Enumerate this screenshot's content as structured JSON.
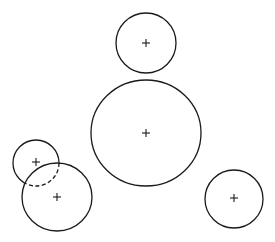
{
  "diagram": {
    "type": "circles",
    "background": "#ffffff",
    "stroke_color": "#1a1a1a",
    "circles": [
      {
        "id": "top",
        "cx": 146,
        "cy": 43,
        "r": 30,
        "center_marker": "+"
      },
      {
        "id": "center-large",
        "cx": 146,
        "cy": 133,
        "rx": 55,
        "ry": 53,
        "center_marker": "+"
      },
      {
        "id": "right",
        "cx": 234,
        "cy": 199,
        "r": 29,
        "center_marker": "+"
      },
      {
        "id": "lower-left-small",
        "cx": 36,
        "cy": 163,
        "r": 23,
        "center_marker": "+",
        "note": "portion inside lower-left-large drawn dashed"
      },
      {
        "id": "lower-left-large",
        "cx": 57,
        "cy": 197,
        "rx": 35,
        "ry": 34,
        "center_marker": "+"
      }
    ]
  }
}
